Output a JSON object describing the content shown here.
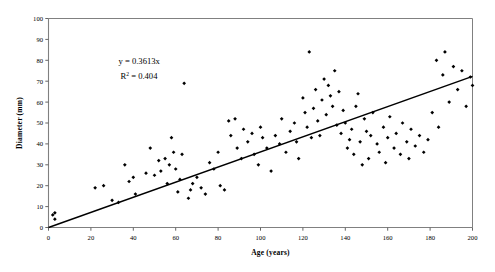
{
  "chart_data": {
    "type": "scatter",
    "title": "",
    "xlabel": "Age (years)",
    "ylabel": "Diameter (mm)",
    "xlim": [
      0,
      200
    ],
    "ylim": [
      0,
      100
    ],
    "xticks": [
      0,
      20,
      40,
      60,
      80,
      100,
      120,
      140,
      160,
      180,
      200
    ],
    "yticks": [
      0,
      10,
      20,
      30,
      40,
      50,
      60,
      70,
      80,
      90,
      100
    ],
    "xtick_labels": [
      "0",
      "20",
      "40",
      "60",
      "80",
      "100",
      "120",
      "140",
      "160",
      "180",
      "200"
    ],
    "ytick_labels": [
      "0",
      "10",
      "20",
      "30",
      "40",
      "50",
      "60",
      "70",
      "80",
      "90",
      "100"
    ],
    "grid": false,
    "legend": false,
    "marker": "filled-diamond",
    "marker_color": "#000000",
    "annotations": [
      {
        "name": "regression-equation",
        "text": "y = 0.3613x",
        "x": 33,
        "y": 78
      },
      {
        "name": "r-squared",
        "text_prefix": "R",
        "text_sup": "2",
        "text_suffix": " = 0.404",
        "x": 33,
        "y": 71
      }
    ],
    "trendline": {
      "name": "linear-fit",
      "equation": "y = 0.3613x",
      "slope": 0.3613,
      "intercept": 0,
      "r_squared": 0.404,
      "color": "#000000",
      "x_start": 0,
      "y_start": 0,
      "x_end": 200,
      "y_end": 72.3
    },
    "series": [
      {
        "name": "tree-measurements",
        "points": [
          [
            2,
            6
          ],
          [
            3,
            4
          ],
          [
            3,
            7
          ],
          [
            22,
            19
          ],
          [
            26,
            20
          ],
          [
            30,
            13
          ],
          [
            33,
            12
          ],
          [
            36,
            30
          ],
          [
            38,
            22
          ],
          [
            40,
            24
          ],
          [
            41,
            16
          ],
          [
            46,
            26
          ],
          [
            48,
            38
          ],
          [
            50,
            25
          ],
          [
            52,
            32
          ],
          [
            53,
            27
          ],
          [
            55,
            33
          ],
          [
            56,
            21
          ],
          [
            57,
            30
          ],
          [
            58,
            43
          ],
          [
            59,
            36
          ],
          [
            60,
            28
          ],
          [
            61,
            17
          ],
          [
            62,
            23
          ],
          [
            63,
            35
          ],
          [
            64,
            69
          ],
          [
            66,
            14
          ],
          [
            67,
            18
          ],
          [
            68,
            21
          ],
          [
            70,
            24
          ],
          [
            72,
            19
          ],
          [
            74,
            16
          ],
          [
            76,
            31
          ],
          [
            78,
            28
          ],
          [
            80,
            36
          ],
          [
            81,
            20
          ],
          [
            83,
            18
          ],
          [
            85,
            51
          ],
          [
            86,
            44
          ],
          [
            88,
            52
          ],
          [
            89,
            38
          ],
          [
            91,
            33
          ],
          [
            92,
            47
          ],
          [
            94,
            41
          ],
          [
            96,
            45
          ],
          [
            97,
            35
          ],
          [
            99,
            30
          ],
          [
            100,
            48
          ],
          [
            101,
            43
          ],
          [
            103,
            38
          ],
          [
            105,
            27
          ],
          [
            107,
            44
          ],
          [
            109,
            40
          ],
          [
            110,
            52
          ],
          [
            112,
            36
          ],
          [
            114,
            46
          ],
          [
            116,
            50
          ],
          [
            117,
            41
          ],
          [
            118,
            33
          ],
          [
            120,
            62
          ],
          [
            121,
            55
          ],
          [
            122,
            48
          ],
          [
            123,
            84
          ],
          [
            124,
            43
          ],
          [
            125,
            57
          ],
          [
            126,
            66
          ],
          [
            127,
            51
          ],
          [
            128,
            44
          ],
          [
            129,
            61
          ],
          [
            130,
            71
          ],
          [
            131,
            54
          ],
          [
            132,
            68
          ],
          [
            133,
            63
          ],
          [
            134,
            58
          ],
          [
            135,
            75
          ],
          [
            136,
            49
          ],
          [
            137,
            65
          ],
          [
            138,
            45
          ],
          [
            139,
            56
          ],
          [
            140,
            50
          ],
          [
            141,
            38
          ],
          [
            142,
            42
          ],
          [
            143,
            47
          ],
          [
            144,
            35
          ],
          [
            145,
            58
          ],
          [
            146,
            64
          ],
          [
            147,
            41
          ],
          [
            148,
            30
          ],
          [
            149,
            52
          ],
          [
            150,
            46
          ],
          [
            151,
            33
          ],
          [
            152,
            44
          ],
          [
            153,
            55
          ],
          [
            155,
            40
          ],
          [
            156,
            36
          ],
          [
            158,
            48
          ],
          [
            159,
            31
          ],
          [
            160,
            43
          ],
          [
            161,
            53
          ],
          [
            163,
            38
          ],
          [
            164,
            45
          ],
          [
            166,
            35
          ],
          [
            167,
            50
          ],
          [
            169,
            41
          ],
          [
            170,
            33
          ],
          [
            171,
            47
          ],
          [
            173,
            39
          ],
          [
            175,
            44
          ],
          [
            177,
            36
          ],
          [
            179,
            42
          ],
          [
            181,
            55
          ],
          [
            183,
            80
          ],
          [
            184,
            48
          ],
          [
            186,
            73
          ],
          [
            187,
            84
          ],
          [
            189,
            60
          ],
          [
            191,
            77
          ],
          [
            193,
            66
          ],
          [
            195,
            75
          ],
          [
            197,
            58
          ],
          [
            199,
            72
          ],
          [
            200,
            68
          ]
        ]
      }
    ]
  }
}
